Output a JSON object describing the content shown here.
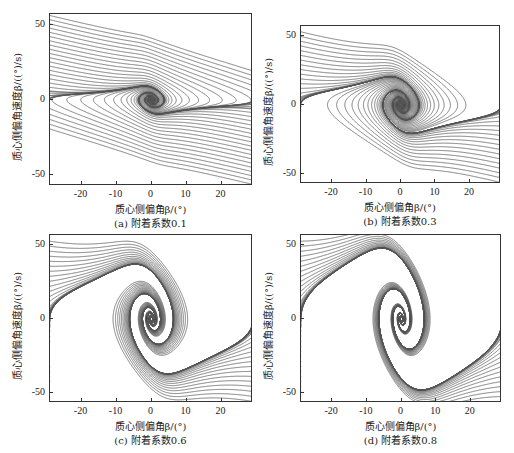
{
  "figure": {
    "xlabel": "质心侧偏角β/(°)",
    "ylabel": "质心侧偏角速度β̇/((°)/s)",
    "line_color": "#555555"
  },
  "chart_data": [
    {
      "type": "line",
      "subtype": "phase-portrait-streamlines",
      "caption": "(a)  附着系数0.1",
      "adhesion_coefficient": 0.1,
      "xlabel": "质心侧偏角β/(°)",
      "ylabel": "质心侧偏角速度β̇/((°)/s)",
      "xlim": [
        -29,
        29
      ],
      "ylim": [
        -57,
        57
      ],
      "xticks": [
        -20,
        -10,
        0,
        10,
        20
      ],
      "yticks": [
        -50,
        0,
        50
      ],
      "grid": false,
      "description": "Nearly horizontal trajectories; gentle S-shaped transition near β≈0; no stable region visible"
    },
    {
      "type": "line",
      "subtype": "phase-portrait-streamlines",
      "caption": "(b)  附着系数0.3",
      "adhesion_coefficient": 0.3,
      "xlabel": "质心侧偏角β/(°)",
      "ylabel": "质心侧偏角速度β̇/((°)/s)",
      "xlim": [
        -29,
        29
      ],
      "ylim": [
        -57,
        57
      ],
      "xticks": [
        -20,
        -10,
        0,
        10,
        20
      ],
      "yticks": [
        -50,
        0,
        50
      ],
      "grid": false,
      "description": "Steeper S-shaped trajectories crossing near origin; small converging region around (0,0); faint saddle branches near β̇≈0"
    },
    {
      "type": "line",
      "subtype": "phase-portrait-streamlines",
      "caption": "(c)  附着系数0.6",
      "adhesion_coefficient": 0.6,
      "xlabel": "质心侧偏角β/(°)",
      "ylabel": "质心侧偏角速度β̇/((°)/s)",
      "xlim": [
        -29,
        29
      ],
      "ylim": [
        -57,
        57
      ],
      "xticks": [
        -20,
        -10,
        0,
        10,
        20
      ],
      "yticks": [
        -50,
        0,
        50
      ],
      "grid": false,
      "description": "Stable focus at origin with steep diagonal separatrix band; saddle points near β≈±5; nested loops on both sides at β̇≈0"
    },
    {
      "type": "line",
      "subtype": "phase-portrait-streamlines",
      "caption": "(d)  附着系数0.8",
      "adhesion_coefficient": 0.8,
      "xlabel": "质心侧偏角β/(°)",
      "ylabel": "质心侧偏角速度β̇/((°)/s)",
      "xlim": [
        -29,
        29
      ],
      "ylim": [
        -57,
        57
      ],
      "xticks": [
        -20,
        -10,
        0,
        10,
        20
      ],
      "yticks": [
        -50,
        0,
        50
      ],
      "grid": false,
      "description": "Wider stable region at origin; separatrix band steeper and wider; saddle points near β≈±6; pronounced nested loops near β̇≈0"
    }
  ],
  "panels": [
    {
      "id": "a",
      "caption": "(a)  附着系数0.1",
      "frame": {
        "left": 49,
        "top": 13,
        "width": 203,
        "height": 172
      }
    },
    {
      "id": "b",
      "caption": "(b)  附着系数0.3",
      "frame": {
        "left": 300,
        "top": 25,
        "width": 200,
        "height": 158
      }
    },
    {
      "id": "c",
      "caption": "(c)  附着系数0.6",
      "frame": {
        "left": 49,
        "top": 234,
        "width": 203,
        "height": 168
      }
    },
    {
      "id": "d",
      "caption": "(d)  附着系数0.8",
      "frame": {
        "left": 300,
        "top": 234,
        "width": 201,
        "height": 168
      }
    }
  ]
}
